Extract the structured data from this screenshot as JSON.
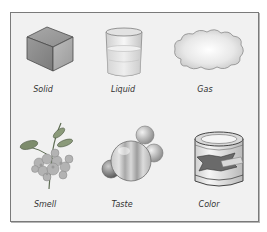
{
  "figure": {
    "items": [
      {
        "id": "solid",
        "label": "Solid",
        "icon": "cube-icon"
      },
      {
        "id": "liquid",
        "label": "Liquid",
        "icon": "beaker-icon"
      },
      {
        "id": "gas",
        "label": "Gas",
        "icon": "cloud-icon"
      },
      {
        "id": "smell",
        "label": "Smell",
        "icon": "flower-plant-icon"
      },
      {
        "id": "taste",
        "label": "Taste",
        "icon": "candy-balls-icon"
      },
      {
        "id": "color",
        "label": "Color",
        "icon": "paint-can-icon"
      }
    ],
    "colors": {
      "frame_bg": "#f1f1f1",
      "frame_border": "#7a7a7a",
      "label_text": "#333333"
    }
  }
}
